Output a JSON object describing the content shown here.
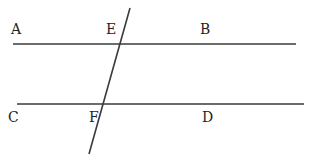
{
  "diagram": {
    "type": "geometry-parallel-lines-transversal",
    "colors": {
      "line": "#3a3a3a",
      "label": "#222222",
      "background": "#ffffff"
    },
    "lines": [
      {
        "id": "AB",
        "x1": 13,
        "y1": 44,
        "x2": 296,
        "y2": 44
      },
      {
        "id": "CD",
        "x1": 17,
        "y1": 104,
        "x2": 304,
        "y2": 104
      },
      {
        "id": "transversal-EF",
        "x1": 130,
        "y1": 8,
        "x2": 89,
        "y2": 154
      }
    ],
    "labels": {
      "A": {
        "text": "A",
        "x": 11,
        "y": 22
      },
      "E": {
        "text": "E",
        "x": 106,
        "y": 22
      },
      "B": {
        "text": "B",
        "x": 200,
        "y": 22
      },
      "C": {
        "text": "C",
        "x": 8,
        "y": 110
      },
      "F": {
        "text": "F",
        "x": 89,
        "y": 110
      },
      "D": {
        "text": "D",
        "x": 202,
        "y": 110
      }
    }
  }
}
